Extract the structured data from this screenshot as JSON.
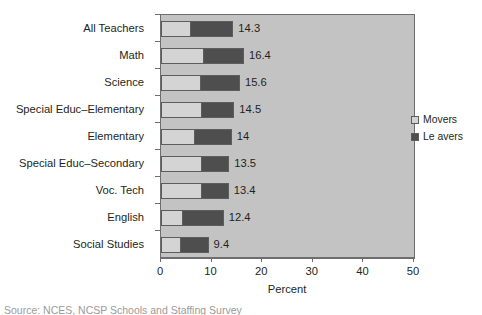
{
  "chart_data": {
    "type": "bar",
    "orientation": "horizontal",
    "stacked": true,
    "title": "",
    "xlabel": "Percent",
    "ylabel": "",
    "xlim": [
      0,
      50
    ],
    "xticks": [
      0,
      10,
      20,
      30,
      40,
      50
    ],
    "grid": false,
    "legend_position": "right",
    "categories": [
      "All Teachers",
      "Math",
      "Science",
      "Special Educ–Elementary",
      "Elementary",
      "Special Educ–Secondary",
      "Voc. Tech",
      "English",
      "Social Studies"
    ],
    "series": [
      {
        "name": "Movers",
        "values": [
          6.0,
          8.5,
          7.9,
          8.2,
          6.7,
          8.1,
          8.1,
          4.4,
          4.0
        ]
      },
      {
        "name": "Leavers",
        "values": [
          8.3,
          7.9,
          7.7,
          6.3,
          7.3,
          5.4,
          5.3,
          8.0,
          5.4
        ]
      }
    ],
    "totals": [
      14.3,
      16.4,
      15.6,
      14.5,
      14,
      13.5,
      13.4,
      12.4,
      9.4
    ],
    "total_labels": [
      "14.3",
      "16.4",
      "15.6",
      "14.5",
      "14",
      "13.5",
      "13.4",
      "12.4",
      "9.4"
    ],
    "colors": {
      "movers": "#d4d4d4",
      "leavers": "#4e4e4e",
      "plot_background": "#c3c3c3",
      "axis": "#6d6d6d",
      "text": "#231f20"
    }
  },
  "legend": {
    "items": [
      {
        "label": "Movers"
      },
      {
        "label": "Le avers"
      }
    ]
  },
  "axis": {
    "x_title": "Percent",
    "tick_labels": [
      "0",
      "10",
      "20",
      "30",
      "40",
      "50"
    ]
  },
  "caption": {
    "text": "Source: NCES, NCSP Schools and Staffing Survey"
  }
}
